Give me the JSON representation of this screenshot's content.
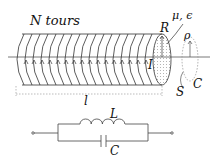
{
  "solenoid": {
    "turns_label": "N tours",
    "radius_label": "R",
    "material_label": "μ,  ϵ",
    "current_label": "I",
    "length_label": "l",
    "turn_count_drawn": 16
  },
  "surface": {
    "rho_label": "ρ",
    "surface_label": "S",
    "contour_label": "C"
  },
  "circuit": {
    "inductor_label": "L",
    "capacitor_label": "C",
    "topology": "parallel LC between two terminals"
  },
  "colors": {
    "line": "#333333",
    "dotted": "#999999"
  }
}
